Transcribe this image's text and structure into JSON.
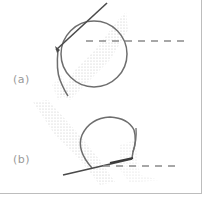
{
  "figure": {
    "panels": [
      {
        "id": "a",
        "label": "(a)"
      },
      {
        "id": "b",
        "label": "(b)"
      }
    ],
    "colors": {
      "curve": "#6e6e6e",
      "needle": "#4a4a4a",
      "dashed": "#8a8a8a",
      "stipple": "#bcbcbc",
      "frame": "#bdbdbd"
    }
  }
}
